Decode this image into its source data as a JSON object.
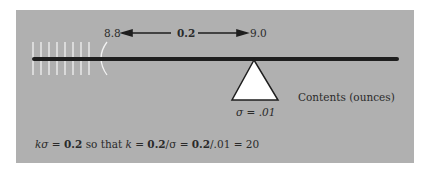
{
  "diagram": {
    "range_low": "8.8",
    "range_width": "0.2",
    "range_high": "9.0",
    "axis_label": "Contents (ounces)",
    "sigma_label": "σ = .01",
    "formula": {
      "part1": "kσ = ",
      "bold1": "0.2",
      "part2": " so that ",
      "part3": "k = ",
      "bold2": "0.2",
      "part4": "/σ = ",
      "bold3": "0.2",
      "part5": "/.01 = 20"
    },
    "colors": {
      "panel": "#b0b0b0",
      "beam": "#1e1e1e",
      "fulcrum": "#ffffff",
      "ticks": "#f2f2f2"
    }
  }
}
